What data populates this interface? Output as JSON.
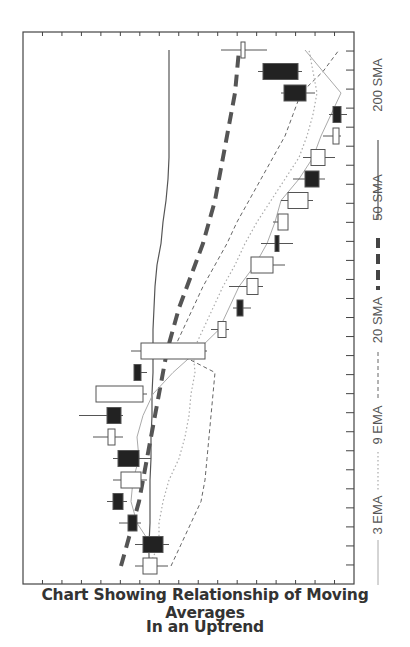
{
  "title": {
    "line1": "Chart Showing Relationship of Moving Averages",
    "line2": "In an Uptrend"
  },
  "chart_data": {
    "type": "candlestick",
    "orientation": "rotated-90-clockwise",
    "xlabel": "",
    "ylabel": "",
    "grid": false,
    "legend_position": "right (vertical text)",
    "legend": [
      {
        "name": "3 EMA",
        "style": "thin solid light gray"
      },
      {
        "name": "9 EMA",
        "style": "dotted light gray"
      },
      {
        "name": "20 SMA",
        "style": "thin dashed gray"
      },
      {
        "name": "50 SMA",
        "style": "thick dashed dark gray"
      },
      {
        "name": "200 SMA",
        "style": "solid dark gray"
      }
    ],
    "note": "Price increases toward the left of the image; time increases toward the top. Values are relative pixel-derived units (0 = bottom/right edge of price, higher = higher price).",
    "candles": [
      {
        "t": 1,
        "open": 134,
        "close": 120,
        "high": 145,
        "low": 112,
        "color": "white"
      },
      {
        "t": 2,
        "open": 120,
        "close": 140,
        "high": 146,
        "low": 112,
        "color": "black"
      },
      {
        "t": 3,
        "open": 105,
        "close": 114,
        "high": 118,
        "low": 96,
        "color": "black"
      },
      {
        "t": 4,
        "open": 90,
        "close": 100,
        "high": 104,
        "low": 84,
        "color": "black"
      },
      {
        "t": 5,
        "open": 98,
        "close": 118,
        "high": 124,
        "low": 90,
        "color": "white"
      },
      {
        "t": 6,
        "open": 95,
        "close": 116,
        "high": 128,
        "low": 90,
        "color": "black"
      },
      {
        "t": 7,
        "open": 85,
        "close": 92,
        "high": 100,
        "low": 70,
        "color": "white"
      },
      {
        "t": 8,
        "open": 84,
        "close": 98,
        "high": 100,
        "low": 56,
        "color": "black"
      },
      {
        "t": 9,
        "open": 73,
        "close": 120,
        "high": 124,
        "low": 73,
        "color": "white"
      },
      {
        "t": 10,
        "open": 111,
        "close": 118,
        "high": 124,
        "low": 111,
        "color": "black"
      },
      {
        "t": 11,
        "open": 118,
        "close": 182,
        "high": 184,
        "low": 108,
        "color": "white"
      },
      {
        "t": 12,
        "open": 195,
        "close": 203,
        "high": 206,
        "low": 188,
        "color": "white"
      },
      {
        "t": 13,
        "open": 214,
        "close": 220,
        "high": 228,
        "low": 210,
        "color": "black"
      },
      {
        "t": 14,
        "open": 224,
        "close": 235,
        "high": 240,
        "low": 206,
        "color": "white"
      },
      {
        "t": 15,
        "open": 228,
        "close": 250,
        "high": 262,
        "low": 228,
        "color": "white"
      },
      {
        "t": 16,
        "open": 252,
        "close": 256,
        "high": 270,
        "low": 238,
        "color": "black"
      },
      {
        "t": 17,
        "open": 255,
        "close": 265,
        "high": 262,
        "low": 250,
        "color": "white"
      },
      {
        "t": 18,
        "open": 265,
        "close": 285,
        "high": 290,
        "low": 258,
        "color": "white"
      },
      {
        "t": 19,
        "open": 282,
        "close": 296,
        "high": 302,
        "low": 270,
        "color": "black"
      },
      {
        "t": 20,
        "open": 288,
        "close": 302,
        "high": 312,
        "low": 280,
        "color": "white"
      },
      {
        "t": 21,
        "open": 310,
        "close": 316,
        "high": 318,
        "low": 300,
        "color": "white"
      },
      {
        "t": 22,
        "open": 310,
        "close": 318,
        "high": 324,
        "low": 306,
        "color": "black"
      },
      {
        "t": 23,
        "open": 261,
        "close": 283,
        "high": 292,
        "low": 258,
        "color": "black"
      },
      {
        "t": 24,
        "open": 240,
        "close": 275,
        "high": 279,
        "low": 235,
        "color": "black"
      },
      {
        "t": 25,
        "open": 218,
        "close": 222,
        "high": 244,
        "low": 198,
        "color": "white"
      }
    ],
    "series": [
      {
        "name": "200 SMA",
        "values": [
          126,
          126,
          127,
          127,
          127,
          128,
          128,
          129,
          129,
          130,
          130,
          130,
          131,
          132,
          134,
          138,
          140,
          143,
          145,
          146,
          146,
          146,
          146,
          146,
          146
        ]
      },
      {
        "name": "50 SMA",
        "values": [
          98,
          104,
          110,
          116,
          120,
          124,
          128,
          132,
          136,
          140,
          144,
          150,
          156,
          164,
          172,
          180,
          186,
          192,
          196,
          200,
          204,
          208,
          212,
          214,
          216
        ]
      },
      {
        "name": "20 SMA",
        "values": [
          148,
          158,
          168,
          178,
          182,
          184,
          186,
          188,
          190,
          192,
          150,
          160,
          170,
          180,
          192,
          204,
          214,
          226,
          238,
          250,
          262,
          270,
          278,
          300,
          316
        ]
      },
      {
        "name": "9 EMA",
        "values": [
          126,
          136,
          136,
          140,
          146,
          156,
          162,
          166,
          168,
          172,
          170,
          180,
          190,
          200,
          212,
          222,
          234,
          248,
          262,
          276,
          284,
          290,
          294,
          290,
          286
        ]
      },
      {
        "name": "3 EMA",
        "values": [
          124,
          128,
          114,
          108,
          110,
          116,
          114,
          120,
          130,
          150,
          174,
          196,
          206,
          216,
          232,
          244,
          252,
          258,
          276,
          290,
          298,
          308,
          318,
          300,
          282
        ]
      }
    ],
    "axis": {
      "right_ticks": 29,
      "top_ticks": 17,
      "bottom_ticks": 17
    }
  },
  "legend_labels": [
    "3 EMA",
    "9 EMA",
    "20 SMA",
    "50 SMA",
    "200 SMA"
  ]
}
